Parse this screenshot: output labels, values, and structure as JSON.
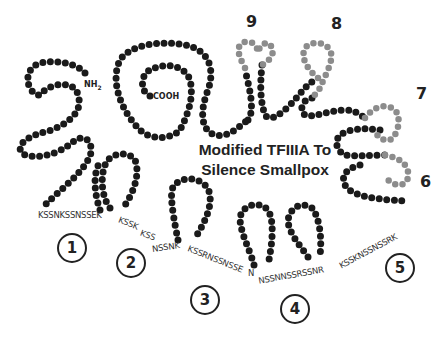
{
  "title_line1": "Modified TFIIIA To",
  "title_line2": "Silence Smallpox",
  "termini": {
    "n": "NH",
    "n_sub": "2",
    "c": "COOH"
  },
  "finger_numbers": {
    "f6": "6",
    "f7": "7",
    "f8": "8",
    "f9": "9"
  },
  "circled_labels": {
    "c1": "1",
    "c2": "2",
    "c3": "3",
    "c4": "4",
    "c5": "5"
  },
  "sequences": {
    "s1": "KSSNKSSNSSEK",
    "s2a": "KSSK",
    "s2b": "KSS",
    "s2c": "NSSNK",
    "s3a": "KSSRNSSNSSE",
    "s3b": "N",
    "s4a": "NSSNNSSRSSNR",
    "s5a": "KSSKNSSNSSRK"
  },
  "colors": {
    "bead_dark": "#1a1a1a",
    "bead_gray": "#8c8c8c",
    "bead_gray_outline": "#555555",
    "text": "#222222"
  }
}
